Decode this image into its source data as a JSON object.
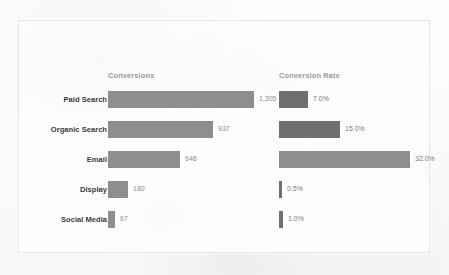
{
  "chart_data": {
    "type": "bar",
    "title": "",
    "orientation": "horizontal",
    "layout": "two-panel",
    "categories": [
      "Paid Search",
      "Organic Search",
      "Email",
      "Display",
      "Social Media"
    ],
    "panels": [
      {
        "header": "Conversions",
        "values": [
          1305,
          937,
          648,
          180,
          67
        ],
        "value_labels": [
          "1,305",
          "937",
          "648",
          "180",
          "67"
        ],
        "max": 1305,
        "bar_color": "#8e8e8e",
        "label_color": "#8e8e8e"
      },
      {
        "header": "Conversion Rate",
        "values": [
          7.0,
          15.0,
          32.0,
          0.5,
          1.0
        ],
        "value_labels": [
          "7.0%",
          "15.0%",
          "32.0%",
          "0.5%",
          "1.0%"
        ],
        "max": 32.0,
        "bar_color": "#6f6f6f",
        "label_color": "#7a7a7a"
      }
    ],
    "xlabel": "",
    "ylabel": "",
    "grid": false,
    "legend": "none",
    "axis_visible": false
  },
  "headers": {
    "conversions": "Conversions",
    "conversion_rate": "Conversion Rate"
  },
  "rows": [
    {
      "label": "Paid Search",
      "conversions": "1,305",
      "conversion_rate": "7.0%"
    },
    {
      "label": "Organic Search",
      "conversions": "937",
      "conversion_rate": "15.0%"
    },
    {
      "label": "Email",
      "conversions": "648",
      "conversion_rate": "32.0%"
    },
    {
      "label": "Display",
      "conversions": "180",
      "conversion_rate": "0.5%"
    },
    {
      "label": "Social Media",
      "conversions": "67",
      "conversion_rate": "1.0%"
    }
  ],
  "colors": {
    "bar_conversions": "#8e8e8e",
    "bar_rate": "#6f6f6f",
    "value_text": "#8e8e8e",
    "header_text": "#9b9b9b",
    "category_text": "#3c3c3c",
    "card_background": "#fefefe",
    "card_border": "#e6e6e6"
  }
}
